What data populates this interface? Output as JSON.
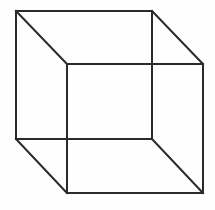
{
  "figure": {
    "name": "Necker cube",
    "type": "line-drawing",
    "width": 215,
    "height": 210,
    "background_color": "#fefefe",
    "line_color": "#2b2b2b",
    "line_width": 2,
    "vertices": {
      "back_top_left": [
        16,
        11
      ],
      "back_top_right": [
        152,
        11
      ],
      "back_bottom_right": [
        152,
        139
      ],
      "back_bottom_left": [
        16,
        139
      ],
      "front_top_left": [
        67,
        64
      ],
      "front_top_right": [
        203,
        64
      ],
      "front_bottom_right": [
        203,
        193
      ],
      "front_bottom_left": [
        67,
        193
      ]
    },
    "edges": [
      {
        "id": "back-face",
        "label": "back square",
        "points": "16,11 152,11 152,139 16,139 16,11"
      },
      {
        "id": "front-face",
        "label": "front square",
        "points": "67,64 203,64 203,193 67,193 67,64"
      },
      {
        "id": "connector-top-left",
        "label": "top-left depth edge",
        "points": "16,11 67,64"
      },
      {
        "id": "connector-top-right",
        "label": "top-right depth edge",
        "points": "152,11 203,64"
      },
      {
        "id": "connector-bottom-right",
        "label": "bottom-right depth edge",
        "points": "152,139 203,193"
      },
      {
        "id": "connector-bottom-left",
        "label": "bottom-left depth edge",
        "points": "16,139 67,193"
      }
    ]
  }
}
